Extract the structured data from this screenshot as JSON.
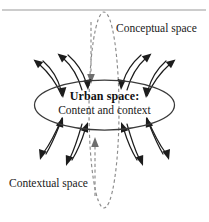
{
  "figure": {
    "title_region": "urban-space-conceptual-contextual-diagram",
    "labels": {
      "conceptual": "Conceptual space",
      "contextual": "Contextual space"
    },
    "center": {
      "title": "Urban space:",
      "subtitle": "Content and context"
    },
    "colors": {
      "background": "#ffffff",
      "ellipse_stroke": "#3a3a3a",
      "dashed_stroke": "#8c8c8c",
      "arrow_stroke": "#1c1c1c",
      "frame_line": "#9a9a9a",
      "text": "#1a1a1a"
    },
    "geometry": {
      "solid_ellipse_center_x": 104.5,
      "solid_ellipse_center_y": 105,
      "solid_ellipse_rx": 70,
      "solid_ellipse_ry": 25,
      "dashed_ellipse_center_x": 104,
      "dashed_ellipse_center_y": 110,
      "dashed_ellipse_rx": 15,
      "dashed_ellipse_ry": 98,
      "frame_line_y": 10
    }
  }
}
